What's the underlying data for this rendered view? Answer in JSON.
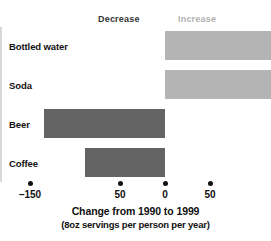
{
  "legend": {
    "decrease_label": "Decrease",
    "increase_label": "Increase"
  },
  "axis": {
    "title": "Change from 1990 to 1999",
    "subtitle": "(8oz servings per person per year)",
    "tick_labels": [
      "–150",
      "50",
      "0",
      "50",
      "150"
    ]
  },
  "categories": {
    "bottled_water": "Bottled water",
    "soda": "Soda",
    "beer": "Beer",
    "coffee": "Coffee"
  },
  "colors": {
    "increase": "#b4b4b4",
    "decrease": "#646464",
    "increase_label": "#b0b0b0",
    "decrease_label": "#333333",
    "zero_line": "#d8d8d8",
    "text": "#111111",
    "background": "#ffffff"
  },
  "chart_data": {
    "type": "bar",
    "orientation": "horizontal",
    "title": "",
    "xlabel": "Change from 1990 to 1999",
    "xlabel_sub": "(8oz servings per person per year)",
    "ylabel": "",
    "categories": [
      "Bottled water",
      "Soda",
      "Beer",
      "Coffee"
    ],
    "values": [
      128,
      132,
      -135,
      -89
    ],
    "xlim": [
      -200,
      200
    ],
    "xticks": [
      -150,
      -50,
      0,
      50,
      150
    ],
    "xtick_labels": [
      "–150",
      "50",
      "0",
      "50",
      "150"
    ],
    "grid": false,
    "legend": [
      "Decrease",
      "Increase"
    ],
    "legend_position": "top",
    "annotations": [
      {
        "text": "Decrease",
        "side": "left"
      },
      {
        "text": "Increase",
        "side": "right"
      }
    ],
    "bar_colors": [
      "#b4b4b4",
      "#b4b4b4",
      "#646464",
      "#646464"
    ]
  }
}
